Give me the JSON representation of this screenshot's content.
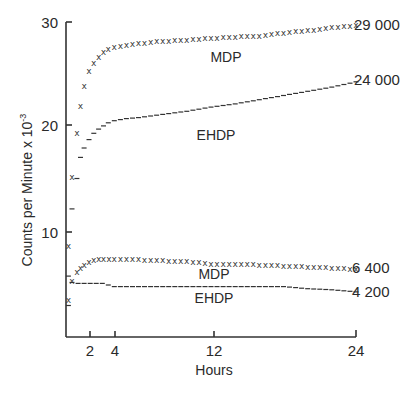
{
  "chart_data": {
    "type": "scatter",
    "title": "",
    "xlabel": "Hours",
    "ylabel": "Counts per Minute x 10⁻³",
    "xlim": [
      0,
      24
    ],
    "ylim": [
      0,
      30
    ],
    "xticks": [
      2,
      4,
      12,
      24
    ],
    "yticks": [
      10,
      20,
      30
    ],
    "grid": false,
    "legend": "inline labels",
    "series": [
      {
        "name": "MDP (upper)",
        "marker": "x",
        "end_label": "29 000",
        "x": [
          0.2,
          0.5,
          0.9,
          1.2,
          1.5,
          1.9,
          2.3,
          2.7,
          3.1,
          3.5,
          4,
          5,
          6,
          8,
          10,
          12,
          14,
          16,
          18,
          20,
          22,
          24
        ],
        "values": [
          8.7,
          15.2,
          19.4,
          22.0,
          23.9,
          25.3,
          26.1,
          26.7,
          27.1,
          27.4,
          27.6,
          27.8,
          28.0,
          28.2,
          28.3,
          28.5,
          28.6,
          28.7,
          29.0,
          29.2,
          29.5,
          29.7
        ]
      },
      {
        "name": "EHDP (upper)",
        "marker": "dash",
        "end_label": "24 000",
        "x": [
          0.2,
          0.5,
          0.9,
          1.2,
          1.5,
          1.9,
          2.3,
          2.7,
          3.1,
          3.5,
          4,
          5,
          6,
          8,
          10,
          12,
          14,
          16,
          18,
          20,
          22,
          24
        ],
        "values": [
          5.8,
          12.2,
          15.1,
          17.1,
          18.0,
          18.8,
          19.4,
          19.8,
          20.1,
          20.4,
          20.6,
          20.8,
          20.9,
          21.2,
          21.5,
          21.9,
          22.2,
          22.6,
          23.0,
          23.4,
          23.8,
          24.3
        ]
      },
      {
        "name": "MDP (lower)",
        "marker": "x",
        "end_label": "6 400",
        "x": [
          0.2,
          0.5,
          0.9,
          1.2,
          1.5,
          1.9,
          2.3,
          2.7,
          3.1,
          4,
          6,
          8,
          10,
          12,
          14,
          16,
          18,
          20,
          22,
          24
        ],
        "values": [
          3.5,
          5.3,
          6.2,
          6.6,
          6.9,
          7.1,
          7.3,
          7.4,
          7.4,
          7.4,
          7.4,
          7.3,
          7.2,
          7.0,
          7.0,
          6.9,
          6.8,
          6.7,
          6.6,
          6.5
        ]
      },
      {
        "name": "EHDP (lower)",
        "marker": "dash",
        "end_label": "4 200",
        "x": [
          0.2,
          0.5,
          1,
          2,
          3,
          4,
          6,
          8,
          10,
          12,
          14,
          16,
          18,
          20,
          22,
          24
        ],
        "values": [
          3.0,
          5.2,
          5.1,
          5.1,
          5.1,
          4.8,
          4.8,
          4.8,
          4.8,
          4.8,
          4.8,
          4.8,
          4.8,
          4.6,
          4.5,
          4.3
        ]
      }
    ],
    "annotations": [
      {
        "text": "MDP",
        "x": 13,
        "y": 26.9
      },
      {
        "text": "EHDP",
        "x": 12,
        "y": 19.2
      },
      {
        "text": "MDP",
        "x": 12,
        "y": 5.2
      },
      {
        "text": "EHDP",
        "x": 12,
        "y": 3.2
      }
    ]
  },
  "axis": {
    "y_ticks": [
      "30",
      "20",
      "10"
    ],
    "x_ticks": [
      "2",
      "4",
      "12",
      "24"
    ],
    "x_title": "Hours",
    "y_title": "Counts per Minute x 10",
    "y_title_exp": "-3"
  },
  "labels": {
    "mdp_upper": "MDP",
    "ehdp_upper": "EHDP",
    "mdp_lower": "MDP",
    "ehdp_lower": "EHDP",
    "end_29000": "29 000",
    "end_24000": "24 000",
    "end_6400": "6 400",
    "end_4200": "4 200"
  }
}
